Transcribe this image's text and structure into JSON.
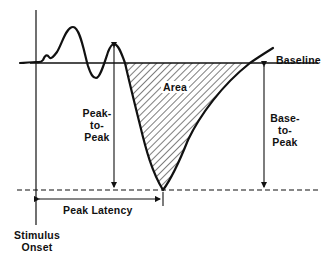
{
  "figure": {
    "colors": {
      "ink": "#111111",
      "background": "#ffffff"
    }
  },
  "labels": {
    "baseline": "Baseline",
    "area": "Area",
    "peak_to_peak": [
      "Peak-",
      "to-",
      "Peak"
    ],
    "base_to_peak": [
      "Base-",
      "to-",
      "Peak"
    ],
    "peak_latency": "Peak Latency",
    "stimulus_onset": [
      "Stimulus",
      "Onset"
    ]
  },
  "geometry": {
    "baseline_y": 63,
    "trough": {
      "x": 163,
      "y": 190
    },
    "stimulus_x": 36,
    "preceding_peak": {
      "x": 114,
      "y": 44
    },
    "dashed_line_y": 190,
    "latency_arrow_y": 199
  }
}
